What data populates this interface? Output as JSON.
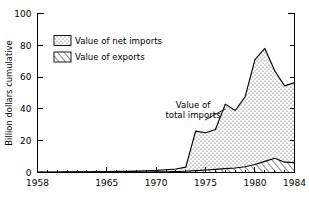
{
  "chart_data": {
    "type": "area",
    "title": "",
    "xlabel": "",
    "ylabel": "Billion dollars cumulative",
    "xlim": [
      1958,
      1984
    ],
    "ylim": [
      0,
      100
    ],
    "ytick_values": [
      0,
      20,
      40,
      60,
      80,
      100
    ],
    "ytick_labels": [
      "0",
      "20",
      "40",
      "60",
      "80",
      "100"
    ],
    "xtick_values": [
      1958,
      1965,
      1970,
      1975,
      1980,
      1984
    ],
    "xtick_labels": [
      "1958",
      "1965",
      "1970",
      "1975",
      "1980",
      "1984"
    ],
    "xtick_minor_step": 1,
    "grid": false,
    "stacked": true,
    "x": [
      1958,
      1959,
      1960,
      1961,
      1962,
      1963,
      1964,
      1965,
      1966,
      1967,
      1968,
      1969,
      1970,
      1971,
      1972,
      1973,
      1974,
      1975,
      1976,
      1977,
      1978,
      1979,
      1980,
      1981,
      1982,
      1983,
      1984
    ],
    "series": [
      {
        "name": "Value of exports",
        "pattern": "hatch",
        "values": [
          0.1,
          0.1,
          0.1,
          0.1,
          0.1,
          0.15,
          0.15,
          0.2,
          0.2,
          0.25,
          0.3,
          0.3,
          0.4,
          0.5,
          0.6,
          0.8,
          1.2,
          1.6,
          2.0,
          2.4,
          2.8,
          3.6,
          5.0,
          7.0,
          9.0,
          6.5,
          6.2
        ]
      },
      {
        "name": "Value of net imports",
        "pattern": "dots",
        "values": [
          0.2,
          0.2,
          0.2,
          0.3,
          0.3,
          0.3,
          0.4,
          0.4,
          0.5,
          0.5,
          0.6,
          0.8,
          0.9,
          1.2,
          1.6,
          2.6,
          24.8,
          23.4,
          25.0,
          40.6,
          36.2,
          44.0,
          66.0,
          71.0,
          55.0,
          48.0,
          50.3
        ]
      }
    ],
    "total_imports": [
      0.3,
      0.3,
      0.3,
      0.4,
      0.4,
      0.45,
      0.55,
      0.6,
      0.7,
      0.75,
      0.9,
      1.1,
      1.3,
      1.7,
      2.2,
      3.4,
      26.0,
      25.0,
      27.0,
      43.0,
      39.0,
      47.6,
      71.0,
      78.0,
      64.0,
      54.5,
      56.5
    ],
    "annotations": [
      {
        "text_line1": "Value of",
        "text_line2": "total imports",
        "points_to_year": 1977,
        "points_to_value": 40
      }
    ],
    "legend": {
      "position": "upper-left",
      "entries": [
        {
          "label": "Value of net imports",
          "pattern": "dots"
        },
        {
          "label": "Value of exports",
          "pattern": "hatch"
        }
      ]
    },
    "colors": {
      "ink": "#000000",
      "background": "#ffffff",
      "fill_dots": "#ffffff",
      "fill_hatch": "#ffffff"
    }
  }
}
